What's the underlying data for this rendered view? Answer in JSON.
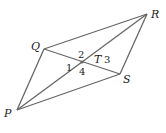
{
  "figure": {
    "type": "parallelogram-with-diagonals",
    "vertices": [
      {
        "name": "P",
        "x": 17,
        "y": 110,
        "label_x": 4,
        "label_y": 117
      },
      {
        "name": "Q",
        "x": 44,
        "y": 49,
        "label_x": 31,
        "label_y": 50
      },
      {
        "name": "R",
        "x": 147,
        "y": 14,
        "label_x": 151,
        "label_y": 18
      },
      {
        "name": "S",
        "x": 120,
        "y": 74,
        "label_x": 123,
        "label_y": 83
      }
    ],
    "intersection": {
      "name": "T",
      "x": 82,
      "y": 62,
      "label_x": 94,
      "label_y": 63
    },
    "angles": [
      {
        "label": "1",
        "x": 66,
        "y": 71
      },
      {
        "label": "2",
        "x": 78,
        "y": 58
      },
      {
        "label": "3",
        "x": 104,
        "y": 63
      },
      {
        "label": "4",
        "x": 79,
        "y": 75
      }
    ],
    "line_color": "#666666",
    "text_color": "#222222"
  }
}
